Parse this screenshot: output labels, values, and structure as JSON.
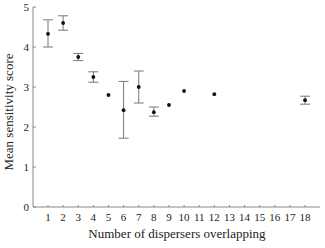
{
  "chart_data": {
    "type": "scatter",
    "title": "",
    "xlabel": "Number of dispersers overlapping",
    "ylabel": "Mean sensitivity score",
    "xlim": [
      0.3,
      18.7
    ],
    "ylim": [
      0,
      5
    ],
    "x_ticks": [
      1,
      2,
      3,
      4,
      5,
      6,
      7,
      8,
      9,
      10,
      11,
      12,
      13,
      14,
      15,
      16,
      17,
      18
    ],
    "y_ticks": [
      0,
      1,
      2,
      3,
      4,
      5
    ],
    "grid": false,
    "legend": null,
    "points": [
      {
        "x": 1,
        "y": 4.33,
        "err_low": 4.0,
        "err_high": 4.68
      },
      {
        "x": 2,
        "y": 4.6,
        "err_low": 4.42,
        "err_high": 4.78
      },
      {
        "x": 3,
        "y": 3.75,
        "err_low": 3.66,
        "err_high": 3.84
      },
      {
        "x": 4,
        "y": 3.25,
        "err_low": 3.12,
        "err_high": 3.38
      },
      {
        "x": 5,
        "y": 2.8
      },
      {
        "x": 6,
        "y": 2.42,
        "err_low": 1.72,
        "err_high": 3.14
      },
      {
        "x": 7,
        "y": 3.0,
        "err_low": 2.6,
        "err_high": 3.4
      },
      {
        "x": 8,
        "y": 2.37,
        "err_low": 2.27,
        "err_high": 2.5
      },
      {
        "x": 9,
        "y": 2.55
      },
      {
        "x": 10,
        "y": 2.9
      },
      {
        "x": 12,
        "y": 2.82
      },
      {
        "x": 18,
        "y": 2.67,
        "err_low": 2.57,
        "err_high": 2.77
      }
    ]
  },
  "colors": {
    "axis": "#888888",
    "marker": "#111111",
    "errorbar": "#777777",
    "text": "#222222"
  }
}
